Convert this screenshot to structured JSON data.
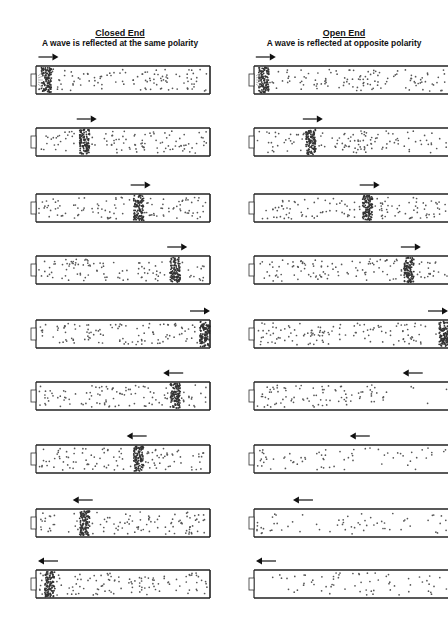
{
  "left_column": {
    "title": "Closed End",
    "subtitle": "A wave is reflected at the same  polarity",
    "end_type": "closed",
    "frames": [
      {
        "pulse_pos": 0.06,
        "direction": "right",
        "pulse_type": "compression",
        "at_source": true
      },
      {
        "pulse_pos": 0.28,
        "direction": "right",
        "pulse_type": "compression"
      },
      {
        "pulse_pos": 0.59,
        "direction": "right",
        "pulse_type": "compression"
      },
      {
        "pulse_pos": 0.8,
        "direction": "right",
        "pulse_type": "compression"
      },
      {
        "pulse_pos": 0.97,
        "direction": "right",
        "pulse_type": "compression"
      },
      {
        "pulse_pos": 0.8,
        "direction": "left",
        "pulse_type": "compression"
      },
      {
        "pulse_pos": 0.59,
        "direction": "left",
        "pulse_type": "compression"
      },
      {
        "pulse_pos": 0.28,
        "direction": "left",
        "pulse_type": "compression"
      },
      {
        "pulse_pos": 0.08,
        "direction": "left",
        "pulse_type": "compression"
      }
    ]
  },
  "right_column": {
    "title": "Open End",
    "subtitle": "A wave is reflected at opposite  polarity",
    "end_type": "open",
    "frames": [
      {
        "pulse_pos": 0.05,
        "direction": "right",
        "pulse_type": "compression",
        "at_source": true
      },
      {
        "pulse_pos": 0.29,
        "direction": "right",
        "pulse_type": "compression"
      },
      {
        "pulse_pos": 0.58,
        "direction": "right",
        "pulse_type": "compression"
      },
      {
        "pulse_pos": 0.79,
        "direction": "right",
        "pulse_type": "compression"
      },
      {
        "pulse_pos": 0.97,
        "direction": "right",
        "pulse_type": "compression"
      },
      {
        "pulse_pos": 0.82,
        "direction": "left",
        "pulse_type": "rarefaction"
      },
      {
        "pulse_pos": 0.55,
        "direction": "left",
        "pulse_type": "rarefaction"
      },
      {
        "pulse_pos": 0.26,
        "direction": "left",
        "pulse_type": "rarefaction"
      },
      {
        "pulse_pos": 0.05,
        "direction": "left",
        "pulse_type": "rarefaction"
      }
    ]
  },
  "colors": {
    "tube_wall": "#222222",
    "particle": "#555555",
    "arrow": "#111111",
    "background": "#ffffff"
  }
}
